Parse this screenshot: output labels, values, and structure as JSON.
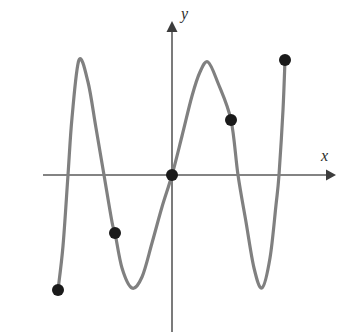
{
  "figure": {
    "title": "",
    "background_color": "#ffffff",
    "width": 354,
    "height": 332
  },
  "axes": {
    "x_axis": {
      "label": "x",
      "color": "#5a5a5a",
      "origin_px": {
        "x": 172,
        "y": 175
      },
      "start_px": {
        "x": 43,
        "y": 175
      },
      "end_px": {
        "x": 334,
        "y": 175
      },
      "arrow": "right"
    },
    "y_axis": {
      "label": "y",
      "color": "#5a5a5a",
      "start_px": {
        "x": 172,
        "y": 332
      },
      "end_px": {
        "x": 172,
        "y": 22
      },
      "arrow": "up"
    }
  },
  "chart_data": {
    "type": "line",
    "title": "",
    "xlabel": "x",
    "ylabel": "y",
    "grid": false,
    "legend": null,
    "curve_color": "#808080",
    "point_color": "#1a1a1a",
    "xlim": [
      -3.15,
      3.95
    ],
    "ylim": [
      -2.8,
      2.8
    ],
    "series": [
      {
        "name": "oscillating curve",
        "description": "Oscillating wave-like curve with two maxima and two minima, crossing the x-axis five times",
        "points_px": [
          {
            "x": 58,
            "y": 290
          },
          {
            "x": 63,
            "y": 246
          },
          {
            "x": 68,
            "y": 175
          },
          {
            "x": 72,
            "y": 118
          },
          {
            "x": 79,
            "y": 60
          },
          {
            "x": 88,
            "y": 82
          },
          {
            "x": 96,
            "y": 128
          },
          {
            "x": 104,
            "y": 175
          },
          {
            "x": 112,
            "y": 222
          },
          {
            "x": 115,
            "y": 233
          },
          {
            "x": 122,
            "y": 268
          },
          {
            "x": 132,
            "y": 288
          },
          {
            "x": 142,
            "y": 277
          },
          {
            "x": 152,
            "y": 243
          },
          {
            "x": 162,
            "y": 207
          },
          {
            "x": 172,
            "y": 175
          },
          {
            "x": 182,
            "y": 136
          },
          {
            "x": 192,
            "y": 96
          },
          {
            "x": 200,
            "y": 72
          },
          {
            "x": 208,
            "y": 62
          },
          {
            "x": 218,
            "y": 83
          },
          {
            "x": 231,
            "y": 120
          },
          {
            "x": 238,
            "y": 175
          },
          {
            "x": 246,
            "y": 222
          },
          {
            "x": 254,
            "y": 268
          },
          {
            "x": 262,
            "y": 288
          },
          {
            "x": 270,
            "y": 258
          },
          {
            "x": 276,
            "y": 205
          },
          {
            "x": 279,
            "y": 175
          },
          {
            "x": 283,
            "y": 110
          },
          {
            "x": 285,
            "y": 60
          }
        ],
        "extrema": [
          {
            "kind": "maximum",
            "x_px": 79,
            "y_px": 60
          },
          {
            "kind": "minimum",
            "x_px": 132,
            "y_px": 288
          },
          {
            "kind": "maximum",
            "x_px": 208,
            "y_px": 62
          },
          {
            "kind": "minimum",
            "x_px": 262,
            "y_px": 288
          }
        ],
        "x_intercepts_px": [
          63,
          104,
          172,
          238,
          279
        ]
      }
    ],
    "marked_points": [
      {
        "name": "left-endpoint-point",
        "x_px": 58,
        "y_px": 290,
        "radius_px": 6
      },
      {
        "name": "lower-left-point",
        "x_px": 115,
        "y_px": 233,
        "radius_px": 6
      },
      {
        "name": "origin-point",
        "x_px": 172,
        "y_px": 175,
        "radius_px": 6
      },
      {
        "name": "upper-right-point",
        "x_px": 231,
        "y_px": 120,
        "radius_px": 6
      },
      {
        "name": "right-endpoint-point",
        "x_px": 285,
        "y_px": 60,
        "radius_px": 6
      }
    ]
  },
  "colors": {
    "curve": "#808080",
    "axis": "#5a5a5a",
    "point": "#1a1a1a",
    "label_text": "#2b2b2b",
    "background": "#ffffff"
  }
}
